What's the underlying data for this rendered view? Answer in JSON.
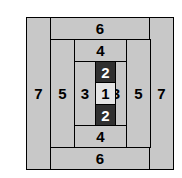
{
  "figure": {
    "background": "#ffffff",
    "band_fill": "#c8c8c8",
    "dark_fill": "#303030",
    "center_fill": "#e4e4e4",
    "stroke": "#000000",
    "dark_text": "#ffffff",
    "light_text": "#000000"
  },
  "cells": {
    "left_outer": "7",
    "right_outer": "7",
    "top_outer": "6",
    "bottom_outer": "6",
    "left_mid": "5",
    "right_mid": "5",
    "top_mid": "4",
    "bottom_mid": "4",
    "left_inner": "3",
    "right_inner": "3",
    "top_inner": "2",
    "bottom_inner": "2",
    "center": "1"
  },
  "row_sequence": [
    "7",
    "5",
    "3",
    "1",
    "3",
    "5",
    "7"
  ],
  "column_sequence": [
    "6",
    "4",
    "2",
    "1",
    "2",
    "4",
    "6"
  ]
}
